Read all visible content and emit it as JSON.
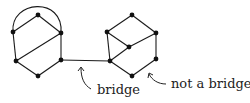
{
  "diagram": {
    "colors": {
      "stroke": "#1a1a1a",
      "node": "#111111",
      "text": "#222222",
      "background": "#ffffff"
    },
    "left_graph": {
      "nodes": [
        {
          "id": "L1",
          "x": 38,
          "y": 15
        },
        {
          "id": "L2",
          "x": 13,
          "y": 32
        },
        {
          "id": "L3",
          "x": 61,
          "y": 33
        },
        {
          "id": "L4",
          "x": 16,
          "y": 61
        },
        {
          "id": "L5",
          "x": 61,
          "y": 60
        },
        {
          "id": "L6",
          "x": 38,
          "y": 76
        }
      ],
      "edges": [
        [
          "L1",
          "L2"
        ],
        [
          "L1",
          "L3"
        ],
        [
          "L2",
          "L4"
        ],
        [
          "L3",
          "L4"
        ],
        [
          "L3",
          "L5"
        ],
        [
          "L4",
          "L6"
        ],
        [
          "L5",
          "L6"
        ]
      ],
      "arc": [
        "L2",
        "L3"
      ]
    },
    "right_graph": {
      "nodes": [
        {
          "id": "R1",
          "x": 132,
          "y": 15
        },
        {
          "id": "R2",
          "x": 107,
          "y": 32
        },
        {
          "id": "R3",
          "x": 156,
          "y": 33
        },
        {
          "id": "R4",
          "x": 129,
          "y": 47
        },
        {
          "id": "R5",
          "x": 110,
          "y": 61
        },
        {
          "id": "R6",
          "x": 156,
          "y": 59
        },
        {
          "id": "R7",
          "x": 132,
          "y": 76
        }
      ],
      "edges": [
        [
          "R1",
          "R2"
        ],
        [
          "R1",
          "R3"
        ],
        [
          "R2",
          "R4"
        ],
        [
          "R4",
          "R3"
        ],
        [
          "R2",
          "R5"
        ],
        [
          "R4",
          "R5"
        ],
        [
          "R3",
          "R6"
        ],
        [
          "R6",
          "R7"
        ],
        [
          "R7",
          "R5"
        ]
      ]
    },
    "bridge_edge": [
      "L5",
      "R5"
    ],
    "labels": {
      "bridge": "bridge",
      "not_bridge": "not a bridge"
    }
  }
}
